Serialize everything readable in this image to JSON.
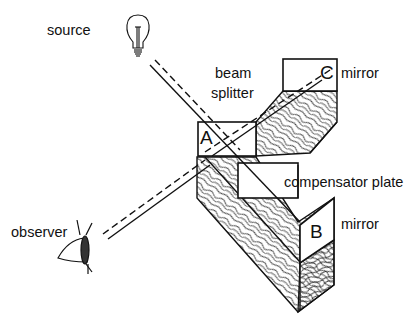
{
  "diagram": {
    "labels": {
      "source": "source",
      "beam_splitter_line1": "beam",
      "beam_splitter_line2": "splitter",
      "mirror_c": "mirror",
      "compensator": "compensator plate",
      "mirror_b": "mirror",
      "observer": "observer"
    },
    "letters": {
      "a": "A",
      "b": "B",
      "c": "C"
    },
    "icons": {
      "source": "light-bulb-icon",
      "observer": "eye-icon"
    },
    "colors": {
      "ink": "#111111",
      "background": "#ffffff"
    }
  }
}
